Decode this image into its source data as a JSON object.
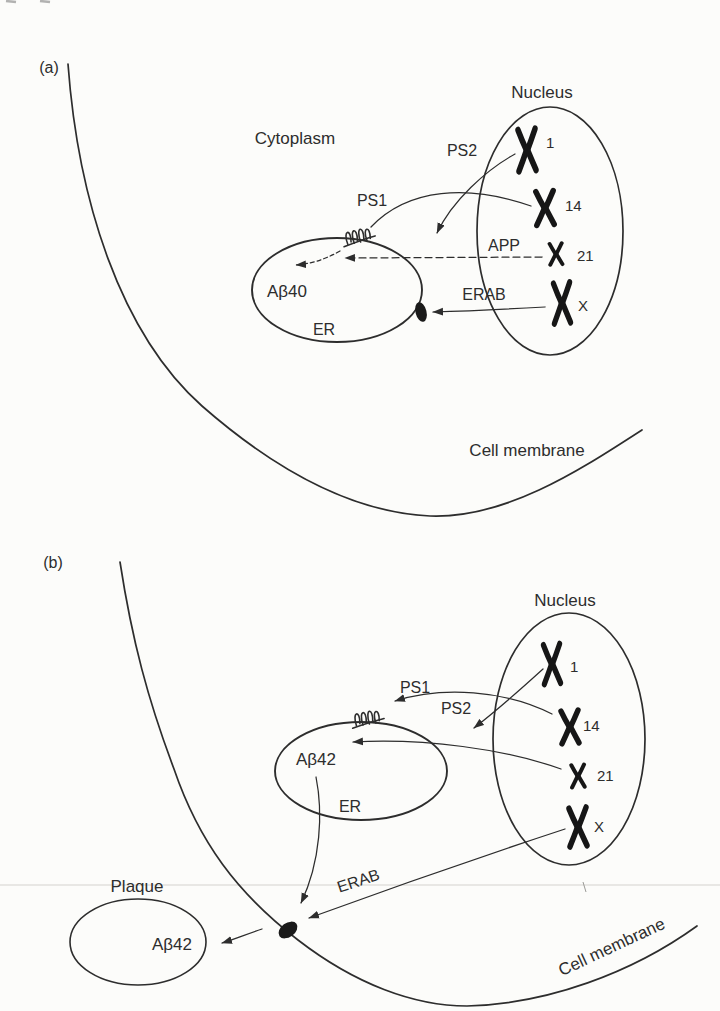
{
  "figure": {
    "background_color": "#fcfcfa",
    "ink_color": "#2d2d2d",
    "chromosome_color": "#161616"
  },
  "panel_a": {
    "tag": "(a)",
    "cytoplasm_label": "Cytoplasm",
    "nucleus_label": "Nucleus",
    "er_label": "ER",
    "abeta40_label": "Aβ40",
    "cell_membrane_label": "Cell membrane",
    "ps1_label": "PS1",
    "ps2_label": "PS2",
    "app_label": "APP",
    "erab_label": "ERAB",
    "chromosomes": [
      "1",
      "14",
      "21",
      "X"
    ]
  },
  "panel_b": {
    "tag": "(b)",
    "nucleus_label": "Nucleus",
    "er_label": "ER",
    "abeta42_er_label": "Aβ42",
    "plaque_label": "Plaque",
    "abeta42_plaque_label": "Aβ42",
    "cell_membrane_label": "Cell membrane",
    "ps1_label": "PS1",
    "ps2_label": "PS2",
    "erab_label": "ERAB",
    "chromosomes": [
      "1",
      "14",
      "21",
      "X"
    ]
  }
}
